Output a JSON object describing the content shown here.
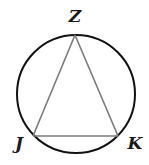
{
  "diagram": {
    "type": "inscribed-triangle-in-circle",
    "circle": {
      "cx": 76,
      "cy": 94,
      "r": 59,
      "stroke": "#111111"
    },
    "triangle": {
      "stroke": "#7a7a7a"
    },
    "points": [
      {
        "name": "Z",
        "x": 75,
        "y": 35,
        "label_x": 75,
        "label_y": 21
      },
      {
        "name": "J",
        "x": 33,
        "y": 136,
        "label_x": 19,
        "label_y": 148
      },
      {
        "name": "K",
        "x": 118,
        "y": 136,
        "label_x": 135,
        "label_y": 148
      }
    ],
    "labels": {
      "Z": "Z",
      "J": "J",
      "K": "K"
    }
  }
}
